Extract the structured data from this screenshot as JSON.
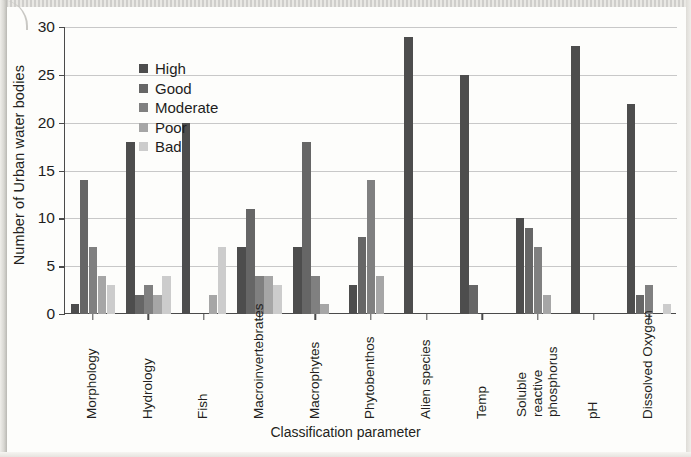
{
  "figure": {
    "axis_title_y": "Number of Urban water bodies",
    "axis_title_x": "Classification parameter"
  },
  "legend": {
    "items": [
      {
        "label": "High",
        "color": "#4d4d4d"
      },
      {
        "label": "Good",
        "color": "#666666"
      },
      {
        "label": "Moderate",
        "color": "#808080"
      },
      {
        "label": "Poor",
        "color": "#a6a6a6"
      },
      {
        "label": "Bad",
        "color": "#cccccc"
      }
    ]
  },
  "chart_data": {
    "type": "bar",
    "title": "",
    "xlabel": "Classification parameter",
    "ylabel": "Number of Urban water bodies",
    "ylim": [
      0,
      30
    ],
    "yticks": [
      0,
      5,
      10,
      15,
      20,
      25,
      30
    ],
    "grid": true,
    "legend_position": "top-left inside",
    "categories": [
      "Morphology",
      "Hydrology",
      "Fish",
      "Macroinvertebrates",
      "Macrophytes",
      "Phytobenthos",
      "Alien species",
      "Temp",
      "Soluble reactive phosphorus",
      "pH",
      "Dissolved Oxygen"
    ],
    "series": [
      {
        "name": "High",
        "color": "#4d4d4d",
        "values": [
          1,
          18,
          20,
          7,
          7,
          3,
          29,
          25,
          10,
          28,
          22
        ]
      },
      {
        "name": "Good",
        "color": "#666666",
        "values": [
          14,
          2,
          0,
          11,
          18,
          8,
          0,
          3,
          9,
          0,
          2
        ]
      },
      {
        "name": "Moderate",
        "color": "#808080",
        "values": [
          7,
          3,
          0,
          4,
          4,
          14,
          0,
          0,
          7,
          0,
          3
        ]
      },
      {
        "name": "Poor",
        "color": "#a6a6a6",
        "values": [
          4,
          2,
          2,
          4,
          1,
          4,
          0,
          0,
          2,
          0,
          0
        ]
      },
      {
        "name": "Bad",
        "color": "#cccccc",
        "values": [
          3,
          4,
          7,
          3,
          0,
          0,
          0,
          0,
          0,
          0,
          1
        ]
      }
    ]
  }
}
